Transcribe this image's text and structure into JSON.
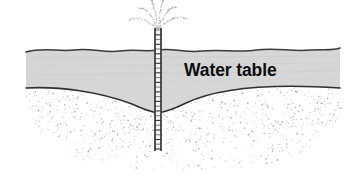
{
  "figure": {
    "kind": "cross-section-diagram",
    "width": 354,
    "height": 178,
    "background_color": "#ffffff"
  },
  "labels": {
    "water_table": "Water table"
  },
  "colors": {
    "saturated_zone_fill": "#d6d6d6",
    "line_stroke": "#3a3a3a",
    "stipple_dot": "#9a9a9a",
    "well_casing": "#2b2b2b",
    "spray_dot": "#8f8f8f",
    "text": "#0d0d0d"
  },
  "elements": {
    "ground_surface": {
      "name": "ground-surface-line",
      "description": "wavy land surface line across the top of the section",
      "y_center": 50
    },
    "saturated_band": {
      "name": "saturated-zone-band",
      "description": "gray band between ground surface and the depressed water table"
    },
    "water_table_curve": {
      "name": "water-table-curve",
      "description": "cone of depression dipping to the well",
      "vertex_x": 158,
      "vertex_y": 113,
      "left_edge_y": 86,
      "right_edge_y": 88
    },
    "stipple_zone": {
      "name": "stippled-aquifer-zone",
      "description": "dotted stipple texture below the water table",
      "dot_count": 1500
    },
    "well": {
      "name": "well-casing",
      "description": "vertical slotted well casing from above ground to below the cone vertex",
      "x_center": 158,
      "top_y": 28,
      "bottom_y": 151,
      "width": 7,
      "rung_count": 26
    },
    "spray": {
      "name": "water-spray-jets",
      "description": "dotted arcing jets of water discharging from the well head",
      "jet_count": 6,
      "origin_x": 158,
      "origin_y": 30
    }
  }
}
